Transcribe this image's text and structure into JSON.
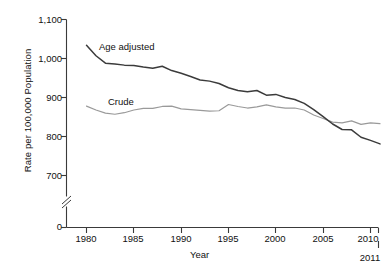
{
  "chart_data": {
    "type": "line",
    "title": "",
    "xlabel": "Year",
    "ylabel": "Rate per 100,000 Population",
    "xlim": [
      1979.0,
      2011.5
    ],
    "ylim": [
      650,
      1120
    ],
    "grid": false,
    "legend_position": "inline-annotations",
    "y_axis_break": true,
    "y_break_between": [
      0,
      650
    ],
    "xticks": [
      1980,
      1985,
      1990,
      1995,
      2000,
      2005,
      2010
    ],
    "xtick_labels": [
      "1980",
      "1985",
      "1990",
      "1995",
      "2000",
      "2005",
      "2010"
    ],
    "extra_xtick": {
      "value": 2011,
      "label": "2011",
      "offset": "below"
    },
    "yticks": [
      0,
      700,
      800,
      900,
      1000,
      1100
    ],
    "ytick_labels": [
      "0",
      "700",
      "800",
      "900",
      "1,000",
      "1,100"
    ],
    "x": [
      1980,
      1981,
      1982,
      1983,
      1984,
      1985,
      1986,
      1987,
      1988,
      1989,
      1990,
      1991,
      1992,
      1993,
      1994,
      1995,
      1996,
      1997,
      1998,
      1999,
      2000,
      2001,
      2002,
      2003,
      2004,
      2005,
      2006,
      2007,
      2008,
      2009,
      2010,
      2011
    ],
    "series": [
      {
        "name": "Age adjusted",
        "color": "#3b3b3b",
        "label_x": 1986.0,
        "label_y": 1035,
        "values": [
          1034,
          1007,
          988,
          986,
          983,
          982,
          978,
          975,
          980,
          969,
          962,
          954,
          945,
          942,
          936,
          925,
          918,
          915,
          918,
          906,
          908,
          900,
          895,
          885,
          869,
          851,
          832,
          818,
          817,
          798,
          790,
          781
        ]
      },
      {
        "name": "Crude",
        "color": "#9a9a9a",
        "label_x": 1986.5,
        "label_y": 905,
        "values": [
          878,
          868,
          860,
          857,
          861,
          868,
          872,
          872,
          877,
          878,
          871,
          869,
          867,
          865,
          866,
          882,
          877,
          873,
          876,
          881,
          876,
          873,
          873,
          868,
          855,
          846,
          837,
          835,
          840,
          831,
          835,
          833
        ]
      }
    ],
    "annotations": [
      {
        "text": "Age adjusted",
        "series": "Age adjusted"
      },
      {
        "text": "Crude",
        "series": "Crude"
      }
    ]
  }
}
